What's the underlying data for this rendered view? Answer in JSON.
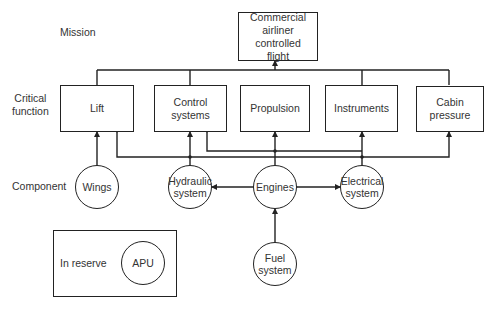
{
  "rows": {
    "mission": "Mission",
    "critical_function": "Critical\nfunction",
    "component": "Component"
  },
  "mission": {
    "label": "Commercial airliner controlled flight"
  },
  "critical_functions": [
    {
      "id": "lift",
      "label": "Lift"
    },
    {
      "id": "control",
      "label": "Control systems"
    },
    {
      "id": "propulsion",
      "label": "Propulsion"
    },
    {
      "id": "instruments",
      "label": "Instruments"
    },
    {
      "id": "cabin",
      "label": "Cabin pressure"
    }
  ],
  "components": [
    {
      "id": "wings",
      "label": "Wings"
    },
    {
      "id": "hydraulic",
      "label": "Hydraulic system"
    },
    {
      "id": "engines",
      "label": "Engines"
    },
    {
      "id": "electrical",
      "label": "Electrical system"
    },
    {
      "id": "fuel",
      "label": "Fuel system"
    }
  ],
  "reserve": {
    "label": "In reserve",
    "component": "APU"
  },
  "connections": [
    {
      "from": "lift",
      "to": "mission"
    },
    {
      "from": "control",
      "to": "mission"
    },
    {
      "from": "propulsion",
      "to": "mission"
    },
    {
      "from": "instruments",
      "to": "mission"
    },
    {
      "from": "cabin",
      "to": "mission"
    },
    {
      "from": "wings",
      "to": "lift"
    },
    {
      "from": "hydraulic",
      "to": "lift"
    },
    {
      "from": "hydraulic",
      "to": "control"
    },
    {
      "from": "engines",
      "to": "control"
    },
    {
      "from": "engines",
      "to": "propulsion"
    },
    {
      "from": "electrical",
      "to": "instruments"
    },
    {
      "from": "electrical",
      "to": "cabin"
    },
    {
      "from": "engines",
      "to": "hydraulic"
    },
    {
      "from": "engines",
      "to": "electrical",
      "bidirectional": true
    },
    {
      "from": "fuel",
      "to": "engines"
    }
  ]
}
